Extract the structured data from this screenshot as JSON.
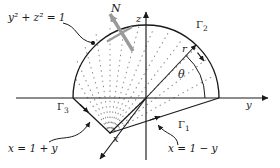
{
  "figure": {
    "background": "#ffffff",
    "stroke": "#1a1a1a",
    "normal_arrow_color": "#9a9a9a",
    "dot_color": "#8a8a8a"
  },
  "axes": {
    "z_label": "z",
    "y_label": "y",
    "x_label": "x",
    "origin": {
      "x": 146,
      "y": 98
    }
  },
  "annotations": {
    "circle_equation": "y² + z² = 1",
    "normal_label": "N",
    "radius_label": "r",
    "angle_label": "θ",
    "line_right": "x = 1 − y",
    "line_left": "x = 1 + y"
  },
  "boundary_curves": [
    {
      "name": "gamma-1",
      "label": "Γ",
      "sub": "1"
    },
    {
      "name": "gamma-2",
      "label": "Γ",
      "sub": "2"
    },
    {
      "name": "gamma-3",
      "label": "Γ",
      "sub": "3"
    }
  ],
  "geometry": {
    "radius": 73,
    "arc_start_deg": 0,
    "arc_end_deg": 180,
    "apex": {
      "x": 110,
      "y": 133
    },
    "ray_count": 9
  }
}
